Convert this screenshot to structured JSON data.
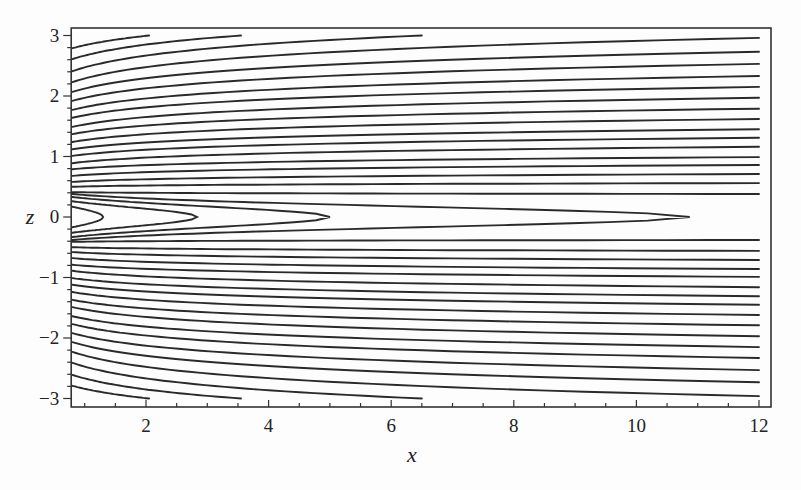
{
  "chart_data": {
    "type": "line",
    "subtype": "contour",
    "title": "",
    "xlabel": "x",
    "ylabel": "z",
    "xlim": [
      0.78,
      12.2
    ],
    "ylim": [
      -3.1,
      3.1
    ],
    "x_ticks": [
      2,
      4,
      6,
      8,
      10,
      12
    ],
    "y_ticks": [
      -3,
      -2,
      -1,
      0,
      1,
      2,
      3
    ],
    "x_tick_labels": [
      "2",
      "4",
      "6",
      "8",
      "10",
      "12"
    ],
    "y_tick_labels": [
      "−3",
      "−2",
      "−1",
      "0",
      "1",
      "2",
      "3"
    ],
    "grid": false,
    "legend": null,
    "line_color": "#2a2a2a",
    "contour_x_start": 0.8,
    "contour_x_end": 12,
    "open_contours_upper": [
      {
        "z_start": 2.79,
        "z_end": 3.0,
        "x_end": 2.05
      },
      {
        "z_start": 2.61,
        "z_end": 3.0,
        "x_end": 3.55
      },
      {
        "z_start": 2.41,
        "z_end": 3.0,
        "x_end": 6.5
      },
      {
        "z_start": 2.23,
        "z_end": 2.96,
        "x_end": 12
      },
      {
        "z_start": 2.07,
        "z_end": 2.73,
        "x_end": 12
      },
      {
        "z_start": 1.92,
        "z_end": 2.53,
        "x_end": 12
      },
      {
        "z_start": 1.77,
        "z_end": 2.33,
        "x_end": 12
      },
      {
        "z_start": 1.64,
        "z_end": 2.15,
        "x_end": 12
      },
      {
        "z_start": 1.49,
        "z_end": 1.97,
        "x_end": 12
      },
      {
        "z_start": 1.37,
        "z_end": 1.79,
        "x_end": 12
      },
      {
        "z_start": 1.24,
        "z_end": 1.62,
        "x_end": 12
      },
      {
        "z_start": 1.12,
        "z_end": 1.45,
        "x_end": 12
      },
      {
        "z_start": 1.01,
        "z_end": 1.31,
        "x_end": 12
      },
      {
        "z_start": 0.89,
        "z_end": 1.16,
        "x_end": 12
      },
      {
        "z_start": 0.79,
        "z_end": 0.99,
        "x_end": 12
      },
      {
        "z_start": 0.68,
        "z_end": 0.86,
        "x_end": 12
      },
      {
        "z_start": 0.58,
        "z_end": 0.71,
        "x_end": 12
      },
      {
        "z_start": 0.5,
        "z_end": 0.56,
        "x_end": 12
      },
      {
        "z_start": 0.41,
        "z_end": 0.38,
        "x_end": 12
      }
    ],
    "closed_contours_tips": [
      {
        "x_tip": 1.3,
        "z_half_at_left": 0.17
      },
      {
        "x_tip": 2.83,
        "z_half_at_left": 0.26
      },
      {
        "x_tip": 5.0,
        "z_half_at_left": 0.33
      },
      {
        "x_tip": 10.87,
        "z_half_at_left": 0.38
      }
    ],
    "symmetry": "contours mirrored about z = 0"
  }
}
